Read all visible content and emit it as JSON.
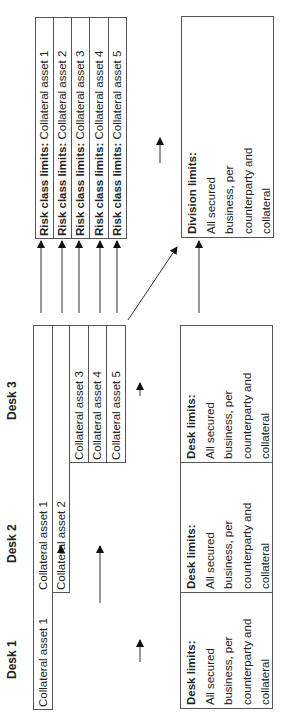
{
  "desks": [
    {
      "label": "Desk 1"
    },
    {
      "label": "Desk 2"
    },
    {
      "label": "Desk 3"
    }
  ],
  "desk_assets": {
    "desk1": [
      "Collateral asset 1"
    ],
    "desk2": [
      "Collateral asset 1",
      "Collateral asset 2"
    ],
    "desk3": [
      "Collateral asset 3",
      "Collateral asset 4",
      "Collateral asset 5"
    ]
  },
  "desk_limits": [
    {
      "title": "Desk limits:",
      "lines": [
        "All secured",
        "business, per",
        "counterparty and",
        "collateral"
      ]
    },
    {
      "title": "Desk limits:",
      "lines": [
        "All secured",
        "business, per",
        "counterparty and",
        "collateral"
      ]
    },
    {
      "title": "Desk limits:",
      "lines": [
        "All secured",
        "business, per",
        "counterparty and",
        "collateral"
      ]
    }
  ],
  "risk_class_limits": [
    {
      "title": "Risk class limits:",
      "asset": "Collateral asset 1"
    },
    {
      "title": "Risk class limits:",
      "asset": "Collateral asset 2"
    },
    {
      "title": "Risk class limits:",
      "asset": "Collateral asset 3"
    },
    {
      "title": "Risk class limits:",
      "asset": "Collateral asset 4"
    },
    {
      "title": "Risk class limits:",
      "asset": "Collateral asset 5"
    }
  ],
  "division_limits": {
    "title": "Division limits:",
    "lines": [
      "All secured",
      "business, per",
      "counterparty and",
      "collateral"
    ]
  }
}
